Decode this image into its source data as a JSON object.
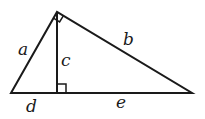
{
  "diagram": {
    "title": "",
    "type": "right-triangle-with-altitude",
    "labels": {
      "a": "a",
      "b": "b",
      "c": "c",
      "d": "d",
      "e": "e"
    },
    "vertices": {
      "left": [
        11,
        93
      ],
      "apex": [
        57,
        12
      ],
      "right": [
        192,
        93
      ],
      "foot": [
        57,
        93
      ]
    },
    "right_angle_markers": [
      "apex",
      "foot"
    ],
    "stroke_color": "#1a1a1a"
  }
}
